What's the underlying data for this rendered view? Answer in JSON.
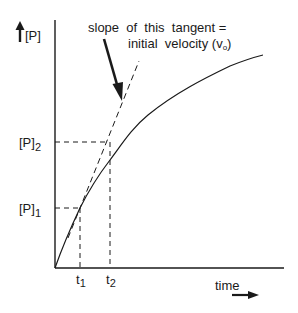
{
  "figure": {
    "y_axis_label": "[P]",
    "x_axis_label": "time",
    "annotation_line1": "slope  of  this  tangent =",
    "annotation_line2": "initial  velocity (v",
    "annotation_subscript": "o",
    "annotation_close": ")",
    "y_ticks": [
      {
        "base": "[P]",
        "sub": "2"
      },
      {
        "base": "[P]",
        "sub": "1"
      }
    ],
    "x_ticks": [
      {
        "base": "t",
        "sub": "1"
      },
      {
        "base": "t",
        "sub": "2"
      }
    ],
    "colors": {
      "ink": "#1a1a1a",
      "background": "#ffffff"
    }
  }
}
